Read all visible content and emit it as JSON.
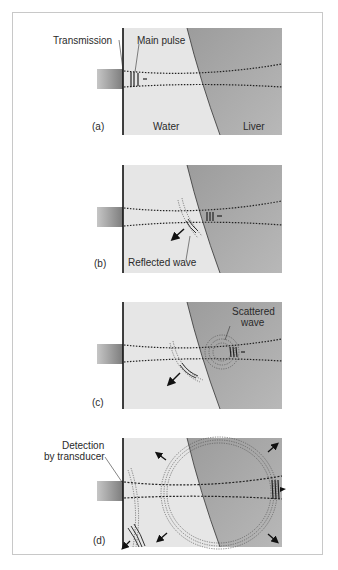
{
  "figure": {
    "panels": [
      {
        "id": "a",
        "label": "(a)",
        "annotations": [
          "Transmission",
          "Main pulse"
        ],
        "regions": [
          "Water",
          "Liver"
        ]
      },
      {
        "id": "b",
        "label": "(b)",
        "annotations": [
          "Reflected wave"
        ]
      },
      {
        "id": "c",
        "label": "(c)",
        "annotations": [
          "Scattered",
          "wave"
        ]
      },
      {
        "id": "d",
        "label": "(d)",
        "annotations": [
          "Detection",
          "by transducer"
        ]
      }
    ],
    "colors": {
      "water": "#e6e6e6",
      "liver": "#a9a9a9",
      "transducer_dark": "#8a8a8a",
      "transducer_light": "#c4c4c4",
      "line": "#1a1a1a"
    }
  }
}
